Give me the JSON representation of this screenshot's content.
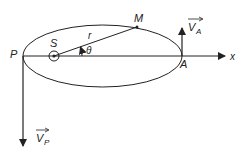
{
  "diagram": {
    "type": "elliptical-orbit",
    "labels": {
      "perihelion": "P",
      "aphelion": "A",
      "focus": "S",
      "planet": "M",
      "radius": "r",
      "angle": "θ",
      "axis": "x",
      "velocity_aphelion": "V",
      "velocity_aphelion_sub": "A",
      "velocity_perihelion": "V",
      "velocity_perihelion_sub": "P"
    },
    "colors": {
      "stroke": "#222222",
      "background": "#ffffff"
    }
  }
}
